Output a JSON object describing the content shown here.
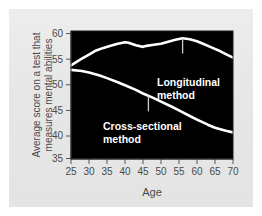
{
  "chart_data": {
    "type": "line",
    "title": "",
    "xlabel": "Age",
    "ylabel": "Average score on a test that measures mental abilities",
    "ylabel_lines": [
      "Average score on a test that",
      "measures mental abilities"
    ],
    "xlim": [
      25,
      70
    ],
    "ylim": [
      35,
      60
    ],
    "xticks": [
      25,
      30,
      35,
      40,
      45,
      50,
      55,
      60,
      65,
      70
    ],
    "yticks": [
      35,
      40,
      45,
      50,
      55,
      60
    ],
    "xtick_labels": [
      "25",
      "30",
      "35",
      "40",
      "45",
      "50",
      "55",
      "60",
      "65",
      "70"
    ],
    "ytick_labels": [
      "35",
      "40",
      "45",
      "50",
      "55",
      "60"
    ],
    "grid": false,
    "legend_position": "inline-annotations",
    "plot_background": "#000000",
    "line_color": "#ffffff",
    "series": [
      {
        "name": "Longitudinal method",
        "x": [
          25,
          28,
          30,
          32,
          34,
          36,
          38,
          40,
          41,
          43,
          45,
          46,
          48,
          50,
          52,
          54,
          56,
          58,
          60,
          62,
          64,
          66,
          68,
          70
        ],
        "values": [
          53.3,
          54.6,
          55.4,
          56.2,
          56.7,
          57.1,
          57.5,
          57.8,
          57.7,
          57.2,
          56.9,
          57.1,
          57.3,
          57.5,
          57.9,
          58.3,
          58.6,
          58.4,
          58.0,
          57.4,
          56.8,
          56.2,
          55.5,
          54.8
        ]
      },
      {
        "name": "Cross-sectional method",
        "x": [
          25,
          28,
          30,
          33,
          35,
          38,
          40,
          43,
          45,
          48,
          50,
          53,
          55,
          58,
          60,
          63,
          65,
          68,
          70
        ],
        "values": [
          52.4,
          52.2,
          51.9,
          51.3,
          50.8,
          50.0,
          49.4,
          48.5,
          47.8,
          46.9,
          46.2,
          45.2,
          44.5,
          43.4,
          42.7,
          41.7,
          41.1,
          40.5,
          40.2
        ]
      }
    ],
    "annotations": [
      {
        "name": "longitudinal-annotation",
        "lines": [
          "Longitudinal",
          "method"
        ],
        "text": "Longitudinal method",
        "color": "#ffffff",
        "leader_from": [
          56,
          58.6
        ],
        "leader_to": [
          56,
          55.6
        ]
      },
      {
        "name": "cross-sectional-annotation",
        "lines": [
          "Cross-sectional",
          "method"
        ],
        "text": "Cross-sectional method",
        "color": "#ffffff",
        "leader_from": [
          46.5,
          47.4
        ],
        "leader_to": [
          46.5,
          44.3
        ]
      }
    ]
  },
  "axes": {
    "x_axis_title": "Age",
    "y_axis_title_line1": "Average score on a test that",
    "y_axis_title_line2": "measures mental abilities"
  },
  "colors": {
    "background": "#e9e9e9",
    "plot_area": "#000000",
    "line": "#ffffff",
    "axis_text": "#4a4a4a",
    "tick": "#555555"
  }
}
